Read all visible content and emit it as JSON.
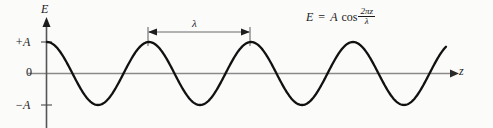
{
  "figure": {
    "axes": {
      "y_axis_label": "E",
      "x_axis_label": "z",
      "y_tick_top": "+A",
      "y_tick_zero": "0",
      "y_tick_bottom": "−A"
    },
    "annotations": {
      "wavelength_symbol": "λ"
    },
    "equation": {
      "lhs": "E",
      "equals": "=",
      "amplitude": "A",
      "function": "cos",
      "numerator": "2πz",
      "denominator": "λ",
      "plain": "E = A cos(2πz/λ)"
    }
  },
  "colors": {
    "background": "#fbfbfa",
    "curve": "#111111",
    "axis": "#8a8a8a",
    "y_axis": "#555555",
    "text": "#1a1a1a"
  },
  "chart_data": {
    "type": "line",
    "title": "",
    "xlabel": "z",
    "ylabel": "E",
    "grid": false,
    "legend": false,
    "function": "E = A cos(2*pi*z/lambda)",
    "amplitude": 1,
    "wavelength": 102,
    "xlim": [
      0,
      446
    ],
    "ylim": [
      -1,
      1
    ],
    "ytick_labels": [
      "+A",
      "0",
      "−A"
    ],
    "ytick_values": [
      1,
      0,
      -1
    ],
    "crest_positions_px": [
      47,
      148,
      250,
      352
    ],
    "trough_positions_px": [
      97,
      199,
      301,
      403
    ],
    "annotation_span_px": [
      148,
      250
    ],
    "series": [
      {
        "name": "E(z)",
        "x": [
          0,
          12.75,
          25.5,
          38.25,
          51,
          63.75,
          76.5,
          89.25,
          102,
          114.75,
          127.5,
          140.25,
          153,
          165.75,
          178.5,
          191.25,
          204,
          216.75,
          229.5,
          242.25,
          255,
          267.75,
          280.5,
          293.25,
          306,
          318.75,
          331.5,
          344.25,
          357,
          369.75,
          382.5,
          395.25,
          408
        ],
        "y": [
          1.0,
          0.707,
          0.0,
          -0.707,
          -1.0,
          -0.707,
          0.0,
          0.707,
          1.0,
          0.707,
          0.0,
          -0.707,
          -1.0,
          -0.707,
          0.0,
          0.707,
          1.0,
          0.707,
          0.0,
          -0.707,
          -1.0,
          -0.707,
          0.0,
          0.707,
          1.0,
          0.707,
          0.0,
          -0.707,
          -1.0,
          -0.707,
          0.0,
          0.707,
          1.0
        ]
      }
    ]
  }
}
